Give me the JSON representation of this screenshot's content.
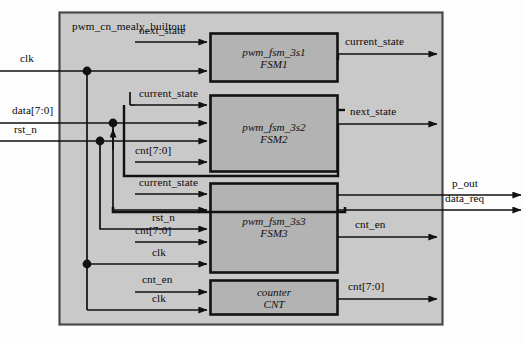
{
  "diagram": {
    "title": "pwm_cn_mealy_builtout",
    "colors": {
      "page_background": "#fdfdfd",
      "outer_block_fill": "#c9c9c9",
      "inner_block_fill": "#b3b3b3",
      "line": "#111111",
      "outer_border": "#3a3a3a"
    },
    "outer_block": {
      "name": "pwm_cn_mealy_builtout",
      "x": 59,
      "y": 12,
      "width": 384,
      "height": 313
    },
    "blocks": [
      {
        "id": "fsm1",
        "module": "pwm_fsm_3s1",
        "instance": "FSM1",
        "x": 210,
        "y": 33,
        "width": 128,
        "height": 49
      },
      {
        "id": "fsm2",
        "module": "pwm_fsm_3s2",
        "instance": "FSM2",
        "x": 210,
        "y": 95,
        "width": 128,
        "height": 77
      },
      {
        "id": "fsm3",
        "module": "pwm_fsm_3s3",
        "instance": "FSM3",
        "x": 210,
        "y": 183,
        "width": 128,
        "height": 90
      },
      {
        "id": "cnt",
        "module": "counter",
        "instance": "CNT",
        "x": 210,
        "y": 280,
        "width": 128,
        "height": 35
      }
    ],
    "external_inputs": [
      {
        "name": "clk",
        "label_x": 20,
        "label_y": 60,
        "wire_y": 71
      },
      {
        "name": "data[7:0]",
        "label_x": 12,
        "label_y": 113,
        "wire_y": 123
      },
      {
        "name": "rst_n",
        "label_x": 14,
        "label_y": 131,
        "wire_y": 141
      }
    ],
    "external_outputs": [
      {
        "name": "p_out",
        "label_x": 455,
        "label_y": 185,
        "wire_y": 195
      },
      {
        "name": "data_req",
        "label_x": 449,
        "label_y": 200,
        "wire_y": 210
      }
    ],
    "internal_signals": [
      {
        "name": "next_state",
        "target": "fsm1",
        "label_x": 175,
        "label_y": 31,
        "wire_y": 42
      },
      {
        "name": "clk",
        "target": "fsm1",
        "label_x": 20,
        "label_y": 60,
        "wire_y": 71
      },
      {
        "name": "current_state",
        "target": "fsm2",
        "label_x": 175,
        "label_y": 94,
        "wire_y": 105
      },
      {
        "name": "data[7:0]",
        "target": "fsm2",
        "label_x": 12,
        "label_y": 113,
        "wire_y": 123
      },
      {
        "name": "rst_n",
        "target": "fsm2",
        "label_x": 14,
        "label_y": 131,
        "wire_y": 141
      },
      {
        "name": "cnt[7:0]",
        "target": "fsm2",
        "label_x": 159,
        "label_y": 151,
        "wire_y": 162
      },
      {
        "name": "current_state",
        "target": "fsm3",
        "label_x": 175,
        "label_y": 183,
        "wire_y": 194
      },
      {
        "name": "rst_n",
        "target": "fsm3",
        "label_x": 159,
        "label_y": 218,
        "wire_y": 229
      },
      {
        "name": "cnt[7:0]",
        "target": "fsm3",
        "label_x": 159,
        "label_y": 231,
        "wire_y": 242
      },
      {
        "name": "clk",
        "target": "fsm3",
        "label_x": 159,
        "label_y": 253,
        "wire_y": 264
      },
      {
        "name": "cnt_en",
        "target": "cnt",
        "label_x": 159,
        "label_y": 280,
        "wire_y": 292
      },
      {
        "name": "clk",
        "target": "cnt",
        "label_x": 159,
        "label_y": 299,
        "wire_y": 310
      }
    ],
    "block_outputs": [
      {
        "name": "current_state",
        "source": "fsm1",
        "label_x": 383,
        "label_y": 43,
        "wire_y": 54
      },
      {
        "name": "next_state",
        "source": "fsm2",
        "label_x": 383,
        "label_y": 113,
        "wire_y": 124
      },
      {
        "name": "cnt_en",
        "source": "fsm3",
        "label_x": 383,
        "label_y": 226,
        "wire_y": 237
      },
      {
        "name": "cnt[7:0]",
        "source": "cnt",
        "label_x": 383,
        "label_y": 288,
        "wire_y": 299
      }
    ],
    "junctions": [
      {
        "signal": "clk",
        "x": 87,
        "y": 71
      },
      {
        "signal": "data[7:0]",
        "x": 113,
        "y": 123
      },
      {
        "signal": "rst_n",
        "x": 100,
        "y": 141
      },
      {
        "signal": "clk",
        "x": 87,
        "y": 264
      }
    ]
  }
}
